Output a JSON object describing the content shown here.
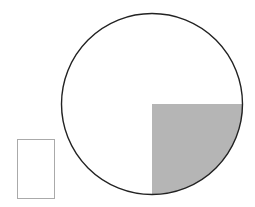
{
  "diagram": {
    "type": "circle-with-shaded-quadrant",
    "circle": {
      "cx": 152,
      "cy": 104,
      "r": 90.5,
      "stroke": "#222222",
      "stroke_width": 1.4,
      "fill": "#ffffff"
    },
    "shaded_quadrant": {
      "position": "bottom-right",
      "fill": "#b5b5b5",
      "fraction": "1/4"
    },
    "side_rectangle": {
      "x": 17.5,
      "y": 139.5,
      "width": 37,
      "height": 59,
      "stroke": "#aaaaaa",
      "fill": "#ffffff"
    }
  }
}
